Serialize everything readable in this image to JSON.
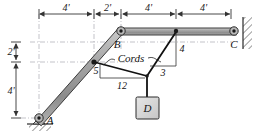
{
  "figure": {
    "members": {
      "ab_label": "AB",
      "bc_label": "BC"
    },
    "joints": [
      {
        "name": "A",
        "label": "A",
        "type": "pin-support-ground"
      },
      {
        "name": "B",
        "label": "B",
        "type": "pin-joint"
      },
      {
        "name": "C",
        "label": "C",
        "type": "pin-support-wall"
      },
      {
        "name": "D",
        "label": "D",
        "type": "hanging-block"
      }
    ],
    "dimensions": {
      "horizontal": [
        {
          "id": "dim-4ft-1",
          "value": "4'"
        },
        {
          "id": "dim-2ft",
          "value": "2'"
        },
        {
          "id": "dim-4ft-2",
          "value": "4'"
        },
        {
          "id": "dim-4ft-3",
          "value": "4'"
        }
      ],
      "vertical": [
        {
          "id": "dim-2ft-v",
          "value": "2'"
        },
        {
          "id": "dim-4ft-v",
          "value": "4'"
        }
      ]
    },
    "cords": {
      "callout": "Cords",
      "left_slope": {
        "rise": "5",
        "run": "12"
      },
      "right_slope": {
        "rise": "4",
        "run": "3"
      }
    },
    "colors": {
      "member_fill": "#9a9a9a",
      "member_edge": "#2b2b2b",
      "block_fill": "#d8d8d8",
      "cord_color": "#111111",
      "dim_color": "#444444",
      "hatch_color": "#555555"
    }
  }
}
